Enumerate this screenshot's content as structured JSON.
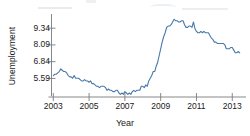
{
  "chart_data": {
    "type": "line",
    "title": "",
    "xlabel": "Year",
    "ylabel": "Unemployment",
    "xlim": [
      2002.9,
      2013.6
    ],
    "ylim": [
      4.2,
      10.25
    ],
    "grid": false,
    "legend": "none",
    "line_color": "#4878a8",
    "axis_color": "#7a7a7a",
    "xticks": [
      2003,
      2005,
      2007,
      2009,
      2011,
      2013
    ],
    "xtick_labels": [
      "2003",
      "2005",
      "2007",
      "2009",
      "2011",
      "2013"
    ],
    "yticks": [
      5.59,
      6.84,
      8.09,
      9.34
    ],
    "ytick_labels": [
      "5.59",
      "6.84",
      "8.09",
      "9.34"
    ],
    "x": [
      2003.0,
      2003.083,
      2003.167,
      2003.25,
      2003.333,
      2003.417,
      2003.5,
      2003.583,
      2003.667,
      2003.75,
      2003.833,
      2003.917,
      2004.0,
      2004.083,
      2004.167,
      2004.25,
      2004.333,
      2004.417,
      2004.5,
      2004.583,
      2004.667,
      2004.75,
      2004.833,
      2004.917,
      2005.0,
      2005.083,
      2005.167,
      2005.25,
      2005.333,
      2005.417,
      2005.5,
      2005.583,
      2005.667,
      2005.75,
      2005.833,
      2005.917,
      2006.0,
      2006.083,
      2006.167,
      2006.25,
      2006.333,
      2006.417,
      2006.5,
      2006.583,
      2006.667,
      2006.75,
      2006.833,
      2006.917,
      2007.0,
      2007.083,
      2007.167,
      2007.25,
      2007.333,
      2007.417,
      2007.5,
      2007.583,
      2007.667,
      2007.75,
      2007.833,
      2007.917,
      2008.0,
      2008.083,
      2008.167,
      2008.25,
      2008.333,
      2008.417,
      2008.5,
      2008.583,
      2008.667,
      2008.75,
      2008.833,
      2008.917,
      2009.0,
      2009.083,
      2009.167,
      2009.25,
      2009.333,
      2009.417,
      2009.5,
      2009.583,
      2009.667,
      2009.75,
      2009.833,
      2009.917,
      2010.0,
      2010.083,
      2010.167,
      2010.25,
      2010.333,
      2010.417,
      2010.5,
      2010.583,
      2010.667,
      2010.75,
      2010.833,
      2010.917,
      2011.0,
      2011.083,
      2011.167,
      2011.25,
      2011.333,
      2011.417,
      2011.5,
      2011.583,
      2011.667,
      2011.75,
      2011.833,
      2011.917,
      2012.0,
      2012.083,
      2012.167,
      2012.25,
      2012.333,
      2012.417,
      2012.5,
      2012.583,
      2012.667,
      2012.75,
      2012.833,
      2012.917,
      2013.0,
      2013.083,
      2013.167,
      2013.25,
      2013.333,
      2013.417
    ],
    "values": [
      5.8,
      5.9,
      5.9,
      6.0,
      6.1,
      6.3,
      6.2,
      6.1,
      6.1,
      6.0,
      5.8,
      5.7,
      5.7,
      5.6,
      5.8,
      5.6,
      5.6,
      5.6,
      5.5,
      5.4,
      5.4,
      5.5,
      5.4,
      5.4,
      5.3,
      5.4,
      5.2,
      5.2,
      5.1,
      5.0,
      5.0,
      4.9,
      5.0,
      5.0,
      5.0,
      4.9,
      4.7,
      4.8,
      4.7,
      4.7,
      4.6,
      4.6,
      4.7,
      4.7,
      4.5,
      4.4,
      4.5,
      4.4,
      4.6,
      4.5,
      4.4,
      4.5,
      4.4,
      4.6,
      4.7,
      4.6,
      4.7,
      4.7,
      4.7,
      5.0,
      5.0,
      4.9,
      5.1,
      5.0,
      5.4,
      5.6,
      5.8,
      6.1,
      6.1,
      6.5,
      6.8,
      7.3,
      7.8,
      8.3,
      8.7,
      9.0,
      9.4,
      9.5,
      9.5,
      9.6,
      9.8,
      10.0,
      9.9,
      9.9,
      9.8,
      9.8,
      9.9,
      9.9,
      9.6,
      9.4,
      9.4,
      9.5,
      9.5,
      9.4,
      9.8,
      9.3,
      9.1,
      9.0,
      9.0,
      9.1,
      9.0,
      9.1,
      9.0,
      9.0,
      9.0,
      8.8,
      8.6,
      8.5,
      8.3,
      8.3,
      8.2,
      8.2,
      8.2,
      8.2,
      8.2,
      8.1,
      7.8,
      7.8,
      7.8,
      7.9,
      7.9,
      7.7,
      7.5,
      7.5,
      7.6,
      7.5
    ]
  }
}
